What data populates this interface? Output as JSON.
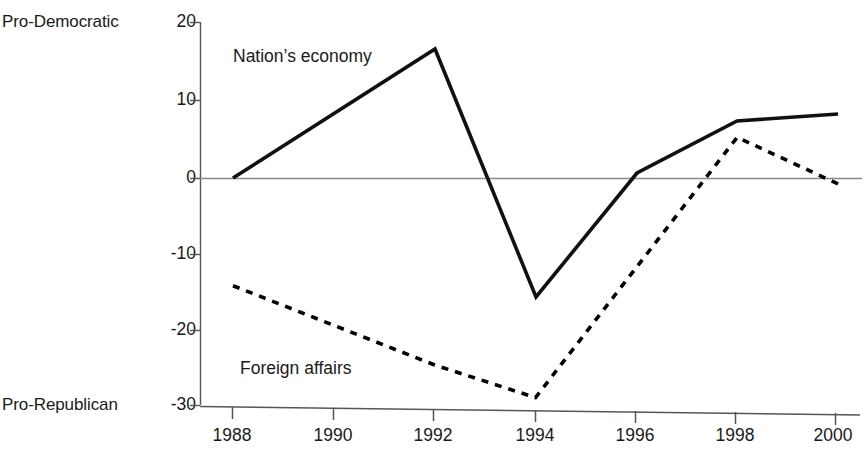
{
  "chart_data": {
    "type": "line",
    "title": "",
    "xlabel": "",
    "ylabel": "",
    "x": [
      1988,
      1990,
      1992,
      1994,
      1996,
      1998,
      2000
    ],
    "xticklabels": [
      "1988",
      "1990",
      "1992",
      "1994",
      "1996",
      "1998",
      "2000"
    ],
    "yticks": [
      20,
      10,
      0,
      -10,
      -20,
      -30
    ],
    "yticklabels": [
      "20",
      "10",
      "0",
      "-10",
      "-20",
      "-30"
    ],
    "ylim": [
      -30,
      20
    ],
    "xlim": [
      1988,
      2000
    ],
    "grid": false,
    "legend": "inline-annotations",
    "zero_line": true,
    "axis_end_labels": {
      "top": "Pro-Democratic",
      "bottom": "Pro-Republican"
    },
    "series": [
      {
        "name": "Nation's economy",
        "style": "solid",
        "color": "#000000",
        "x": [
          1988,
          1992,
          1994,
          1996,
          1998,
          2000
        ],
        "values": [
          0,
          16.5,
          -15.3,
          0.6,
          7.3,
          8.2
        ]
      },
      {
        "name": "Foreign affairs",
        "style": "dotted",
        "color": "#000000",
        "x": [
          1988,
          1992,
          1994,
          1998,
          2000
        ],
        "values": [
          -13.8,
          -24.0,
          -28.2,
          5.3,
          -0.7
        ]
      }
    ]
  },
  "labels": {
    "pro_democratic": "Pro-Democratic",
    "pro_republican": "Pro-Republican",
    "series_economy": "Nation’s economy",
    "series_foreign": "Foreign affairs"
  }
}
